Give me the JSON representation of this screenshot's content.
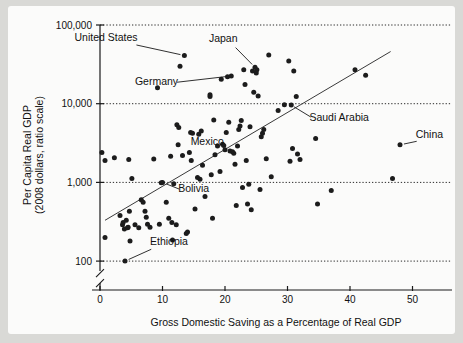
{
  "chart_data": {
    "type": "scatter",
    "title": "",
    "xlabel": "Gross Domestic Saving as a Percentage of Real GDP",
    "ylabel": "Per Capita Real GDP\n(2008 dollars, ratio scale)",
    "ylabel_line1": "Per Capita Real GDP",
    "ylabel_line2": "(2008 dollars, ratio scale)",
    "yscale": "log",
    "ylim": [
      100,
      100000
    ],
    "xlim": [
      -2,
      56
    ],
    "grid": true,
    "legend": null,
    "xticks": [
      0,
      10,
      20,
      30,
      40,
      50
    ],
    "xtick_labels": [
      "0",
      "10",
      "20",
      "30",
      "40",
      "50"
    ],
    "yticks": [
      100,
      1000,
      10000,
      100000
    ],
    "ytick_labels": [
      "100",
      "1,000",
      "10,000",
      "100,000"
    ],
    "axis_break": true,
    "trend_line": {
      "x_start": 0.8,
      "y_start": 330,
      "x_end": 46.5,
      "y_end": 46000
    },
    "annotations": [
      {
        "label": "United States",
        "x": 13.5,
        "y": 41000,
        "label_x": 6.0,
        "label_y": 62000
      },
      {
        "label": "Japan",
        "x": 24.8,
        "y": 29000,
        "label_x": 22.0,
        "label_y": 60000
      },
      {
        "label": "Germany",
        "x": 21.0,
        "y": 22500,
        "label_x": 12.5,
        "label_y": 17500
      },
      {
        "label": "Saudi Arabia",
        "x": 30.5,
        "y": 9700,
        "label_x": 33.5,
        "label_y": 6100
      },
      {
        "label": "China",
        "x": 48.0,
        "y": 3000,
        "label_x": 50.5,
        "label_y": 3700
      },
      {
        "label": "Mexico",
        "x": 12.5,
        "y": 3000,
        "label_x": 14.5,
        "label_y": 2950
      },
      {
        "label": "Bolivia",
        "x": 10.0,
        "y": 1000,
        "label_x": 12.5,
        "label_y": 750
      },
      {
        "label": "Ethiopia",
        "x": 4.0,
        "y": 100,
        "label_x": 8.0,
        "label_y": 160
      }
    ],
    "points": [
      [
        0.3,
        2400
      ],
      [
        0.8,
        1900
      ],
      [
        0.8,
        200
      ],
      [
        2.3,
        2050
      ],
      [
        3.2,
        380
      ],
      [
        3.6,
        290
      ],
      [
        3.7,
        310
      ],
      [
        3.9,
        255
      ],
      [
        4.0,
        100
      ],
      [
        4.2,
        330
      ],
      [
        4.4,
        265
      ],
      [
        4.5,
        270
      ],
      [
        4.6,
        1950
      ],
      [
        4.7,
        430
      ],
      [
        4.8,
        180
      ],
      [
        5.1,
        1120
      ],
      [
        5.6,
        290
      ],
      [
        6.2,
        265
      ],
      [
        6.6,
        600
      ],
      [
        6.9,
        560
      ],
      [
        7.2,
        430
      ],
      [
        7.4,
        360
      ],
      [
        7.6,
        295
      ],
      [
        8.0,
        270
      ],
      [
        8.6,
        1980
      ],
      [
        9.2,
        16000
      ],
      [
        9.5,
        295
      ],
      [
        9.8,
        990
      ],
      [
        10.0,
        1000
      ],
      [
        10.6,
        560
      ],
      [
        11.0,
        350
      ],
      [
        11.3,
        2150
      ],
      [
        11.5,
        310
      ],
      [
        11.6,
        185
      ],
      [
        11.8,
        960
      ],
      [
        12.2,
        290
      ],
      [
        12.3,
        5400
      ],
      [
        12.5,
        3000
      ],
      [
        12.6,
        5000
      ],
      [
        12.8,
        30000
      ],
      [
        13.2,
        2200
      ],
      [
        13.5,
        41000
      ],
      [
        13.8,
        225
      ],
      [
        14.0,
        235
      ],
      [
        14.3,
        2400
      ],
      [
        14.5,
        4300
      ],
      [
        14.6,
        1900
      ],
      [
        14.8,
        4200
      ],
      [
        15.2,
        460
      ],
      [
        15.6,
        1150
      ],
      [
        15.8,
        4100
      ],
      [
        16.0,
        1100
      ],
      [
        16.2,
        4500
      ],
      [
        16.4,
        1650
      ],
      [
        16.8,
        660
      ],
      [
        17.6,
        12300
      ],
      [
        17.6,
        13000
      ],
      [
        17.8,
        1250
      ],
      [
        18.0,
        350
      ],
      [
        18.2,
        6200
      ],
      [
        18.4,
        2250
      ],
      [
        18.8,
        2900
      ],
      [
        19.2,
        1380
      ],
      [
        19.4,
        20500
      ],
      [
        19.6,
        3050
      ],
      [
        19.8,
        2950
      ],
      [
        20.0,
        2600
      ],
      [
        20.2,
        4300
      ],
      [
        20.4,
        22000
      ],
      [
        20.6,
        5800
      ],
      [
        20.8,
        2500
      ],
      [
        21.0,
        22500
      ],
      [
        21.2,
        2450
      ],
      [
        21.4,
        2350
      ],
      [
        21.6,
        1700
      ],
      [
        21.8,
        510
      ],
      [
        22.0,
        2900
      ],
      [
        22.2,
        4700
      ],
      [
        22.4,
        5200
      ],
      [
        22.6,
        6100
      ],
      [
        22.8,
        860
      ],
      [
        23.0,
        27000
      ],
      [
        23.2,
        17500
      ],
      [
        23.4,
        1900
      ],
      [
        23.6,
        530
      ],
      [
        23.8,
        950
      ],
      [
        24.0,
        5100
      ],
      [
        24.2,
        450
      ],
      [
        24.4,
        26000
      ],
      [
        24.6,
        14000
      ],
      [
        24.8,
        29000
      ],
      [
        25.0,
        24500
      ],
      [
        25.1,
        27000
      ],
      [
        25.3,
        12500
      ],
      [
        25.6,
        810
      ],
      [
        25.8,
        3800
      ],
      [
        26.0,
        4200
      ],
      [
        26.2,
        4700
      ],
      [
        26.6,
        2000
      ],
      [
        27.0,
        41500
      ],
      [
        27.4,
        1180
      ],
      [
        28.5,
        8200
      ],
      [
        29.5,
        9700
      ],
      [
        30.2,
        35000
      ],
      [
        30.4,
        1850
      ],
      [
        30.6,
        9600
      ],
      [
        30.8,
        2700
      ],
      [
        31.0,
        26000
      ],
      [
        31.4,
        12300
      ],
      [
        31.6,
        2300
      ],
      [
        32.0,
        1950
      ],
      [
        34.5,
        3600
      ],
      [
        34.8,
        530
      ],
      [
        37.0,
        790
      ],
      [
        40.8,
        27000
      ],
      [
        42.5,
        23000
      ],
      [
        46.8,
        1120
      ],
      [
        48.0,
        3000
      ]
    ]
  },
  "figure": {
    "background_color": "#d9d9d6",
    "card_color": "#fbfbfa",
    "dot_color": "#1c1c1c",
    "axis_color": "#1a1a1a"
  }
}
